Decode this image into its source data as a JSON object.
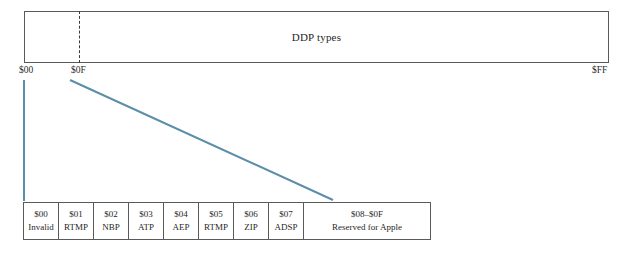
{
  "diagram": {
    "range_bar": {
      "label": "DDP types",
      "axis_start": "$00",
      "axis_divider": "$0F",
      "axis_end": "$FF",
      "border_color": "#5a5a5a",
      "divider_style": "dashed"
    },
    "connectors": {
      "color": "#5b8ea8",
      "left_line": "vertical",
      "right_line": "diagonal"
    },
    "detail_table": {
      "cells": [
        {
          "code": "$00",
          "name": "Invalid"
        },
        {
          "code": "$01",
          "name": "RTMP"
        },
        {
          "code": "$02",
          "name": "NBP"
        },
        {
          "code": "$03",
          "name": "ATP"
        },
        {
          "code": "$04",
          "name": "AEP"
        },
        {
          "code": "$05",
          "name": "RTMP"
        },
        {
          "code": "$06",
          "name": "ZIP"
        },
        {
          "code": "$07",
          "name": "ADSP"
        },
        {
          "code": "$08–$0F",
          "name": "Reserved for Apple"
        }
      ]
    }
  }
}
